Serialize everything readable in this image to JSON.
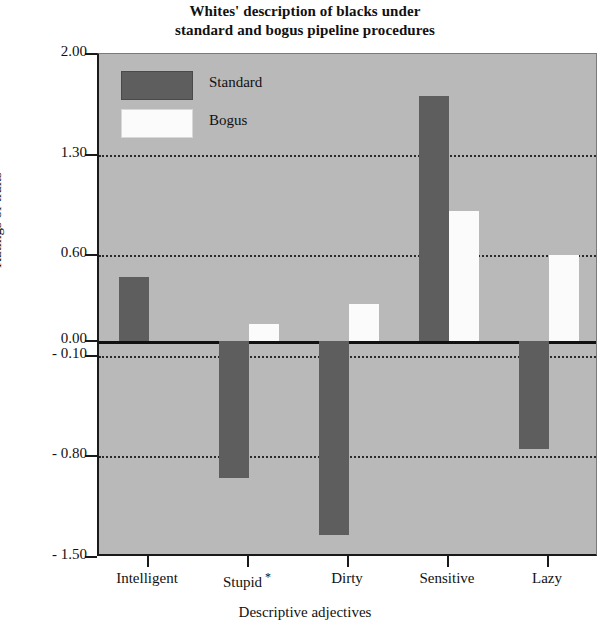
{
  "chart_data": {
    "type": "bar",
    "title": "Whites' description of blacks under standard and bogus pipeline procedures",
    "title_lines": [
      "Whites' description of blacks under",
      "standard and bogus pipeline procedures"
    ],
    "xlabel": "Descriptive adjectives",
    "ylabel": "Ratings of traits",
    "categories": [
      "Intelligent",
      "Stupid",
      "Dirty",
      "Sensitive",
      "Lazy"
    ],
    "category_annotations": [
      "",
      "*",
      "",
      "",
      ""
    ],
    "series": [
      {
        "name": "Standard",
        "color": "#5e5e5e",
        "values": [
          0.45,
          -0.95,
          -1.35,
          1.71,
          -0.75
        ]
      },
      {
        "name": "Bogus",
        "color": "#fbfbfb",
        "values": [
          0.0,
          0.12,
          0.26,
          0.91,
          0.6
        ]
      }
    ],
    "ylim": [
      -1.5,
      2.0
    ],
    "ytick_values": [
      2.0,
      1.3,
      0.6,
      0.0,
      -0.1,
      -0.8,
      -1.5
    ],
    "ytick_labels": [
      "2.00",
      "1.30",
      "0.60",
      "0.00",
      "- 0.10",
      "- 0.80",
      "- 1.50"
    ],
    "gridlines_at": [
      1.3,
      0.6,
      -0.1,
      -0.8
    ],
    "zero_line_at": 0.0,
    "grid": true,
    "legend_position": "upper-left",
    "plot_background": "#b9b9b9"
  },
  "legend": {
    "items": [
      {
        "label": "Standard"
      },
      {
        "label": "Bogus"
      }
    ]
  }
}
